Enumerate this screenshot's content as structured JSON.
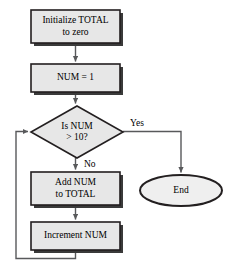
{
  "diagram": {
    "type": "flowchart",
    "canvas": {
      "width": 236,
      "height": 273
    },
    "style": {
      "shape_fill": "#e7e7e7",
      "shape_stroke": "#231f20",
      "shadow_color": "#3a3a3a",
      "terminator_fill": "#efefef",
      "connector_color": "#58595b",
      "background": "#ffffff"
    },
    "nodes": [
      {
        "id": "init",
        "shape": "process",
        "line1": "Initialize TOTAL",
        "line2": "to zero",
        "x": 31,
        "y": 10,
        "w": 89,
        "h": 33
      },
      {
        "id": "setnum",
        "shape": "process",
        "line1": "NUM = 1",
        "line2": "",
        "x": 31,
        "y": 64,
        "w": 89,
        "h": 28
      },
      {
        "id": "decision",
        "shape": "decision",
        "line1": "Is NUM",
        "line2": "> 10?",
        "x": 31,
        "y": 106,
        "w": 92,
        "h": 52
      },
      {
        "id": "add",
        "shape": "process",
        "line1": "Add NUM",
        "line2": "to TOTAL",
        "x": 31,
        "y": 172,
        "w": 89,
        "h": 33
      },
      {
        "id": "increment",
        "shape": "process",
        "line1": "Increment NUM",
        "line2": "",
        "x": 31,
        "y": 222,
        "w": 89,
        "h": 28
      },
      {
        "id": "end",
        "shape": "terminator",
        "line1": "End",
        "line2": "",
        "x": 140,
        "y": 175,
        "w": 82,
        "h": 31
      }
    ],
    "edge_labels": [
      {
        "id": "yes",
        "text": "Yes",
        "x": 130,
        "y": 118
      },
      {
        "id": "no",
        "text": "No",
        "x": 84,
        "y": 159
      }
    ],
    "edges": [
      {
        "from": "init",
        "to": "setnum",
        "label": ""
      },
      {
        "from": "setnum",
        "to": "decision",
        "label": ""
      },
      {
        "from": "decision",
        "to": "end",
        "label": "Yes"
      },
      {
        "from": "decision",
        "to": "add",
        "label": "No"
      },
      {
        "from": "add",
        "to": "increment",
        "label": ""
      },
      {
        "from": "increment",
        "to": "decision",
        "label": ""
      }
    ]
  }
}
